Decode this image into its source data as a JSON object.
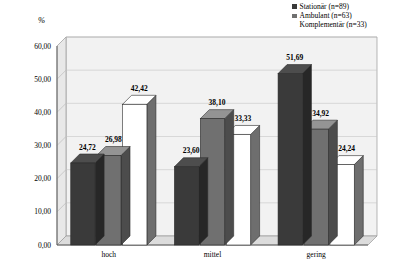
{
  "chart_data": {
    "type": "bar",
    "title": "",
    "subtitle": "",
    "xlabel": "",
    "ylabel": "%",
    "categories": [
      "hoch",
      "mittel",
      "gering"
    ],
    "series": [
      {
        "name": "Stationär (n=89)",
        "values": [
          24.72,
          23.6,
          51.69
        ],
        "color": "#3a3a3a"
      },
      {
        "name": "Ambulant (n=63)",
        "values": [
          26.98,
          38.1,
          34.92
        ],
        "color": "#707070"
      },
      {
        "name": "Komplementär (n=33)",
        "values": [
          42.42,
          33.33,
          24.24
        ],
        "color": "#ffffff"
      }
    ],
    "value_labels": [
      [
        "24,72",
        "23,60",
        "51,69"
      ],
      [
        "26,98",
        "38,10",
        "34,92"
      ],
      [
        "42,42",
        "33,33",
        "24,24"
      ]
    ],
    "ylim": [
      0,
      60
    ],
    "yticks": [
      0,
      10,
      20,
      30,
      40,
      50,
      60
    ],
    "ytick_labels": [
      "0,00",
      "10,00",
      "20,00",
      "30,00",
      "40,00",
      "50,00",
      "60,00"
    ],
    "grid": true,
    "legend_position": "top-right",
    "three_d": true
  },
  "legend": {
    "items": [
      {
        "label": "Stationär (n=89)"
      },
      {
        "label": "Ambulant (n=63)"
      },
      {
        "label": "Komplementär (n=33)"
      }
    ]
  },
  "axis": {
    "y_title": "%"
  }
}
